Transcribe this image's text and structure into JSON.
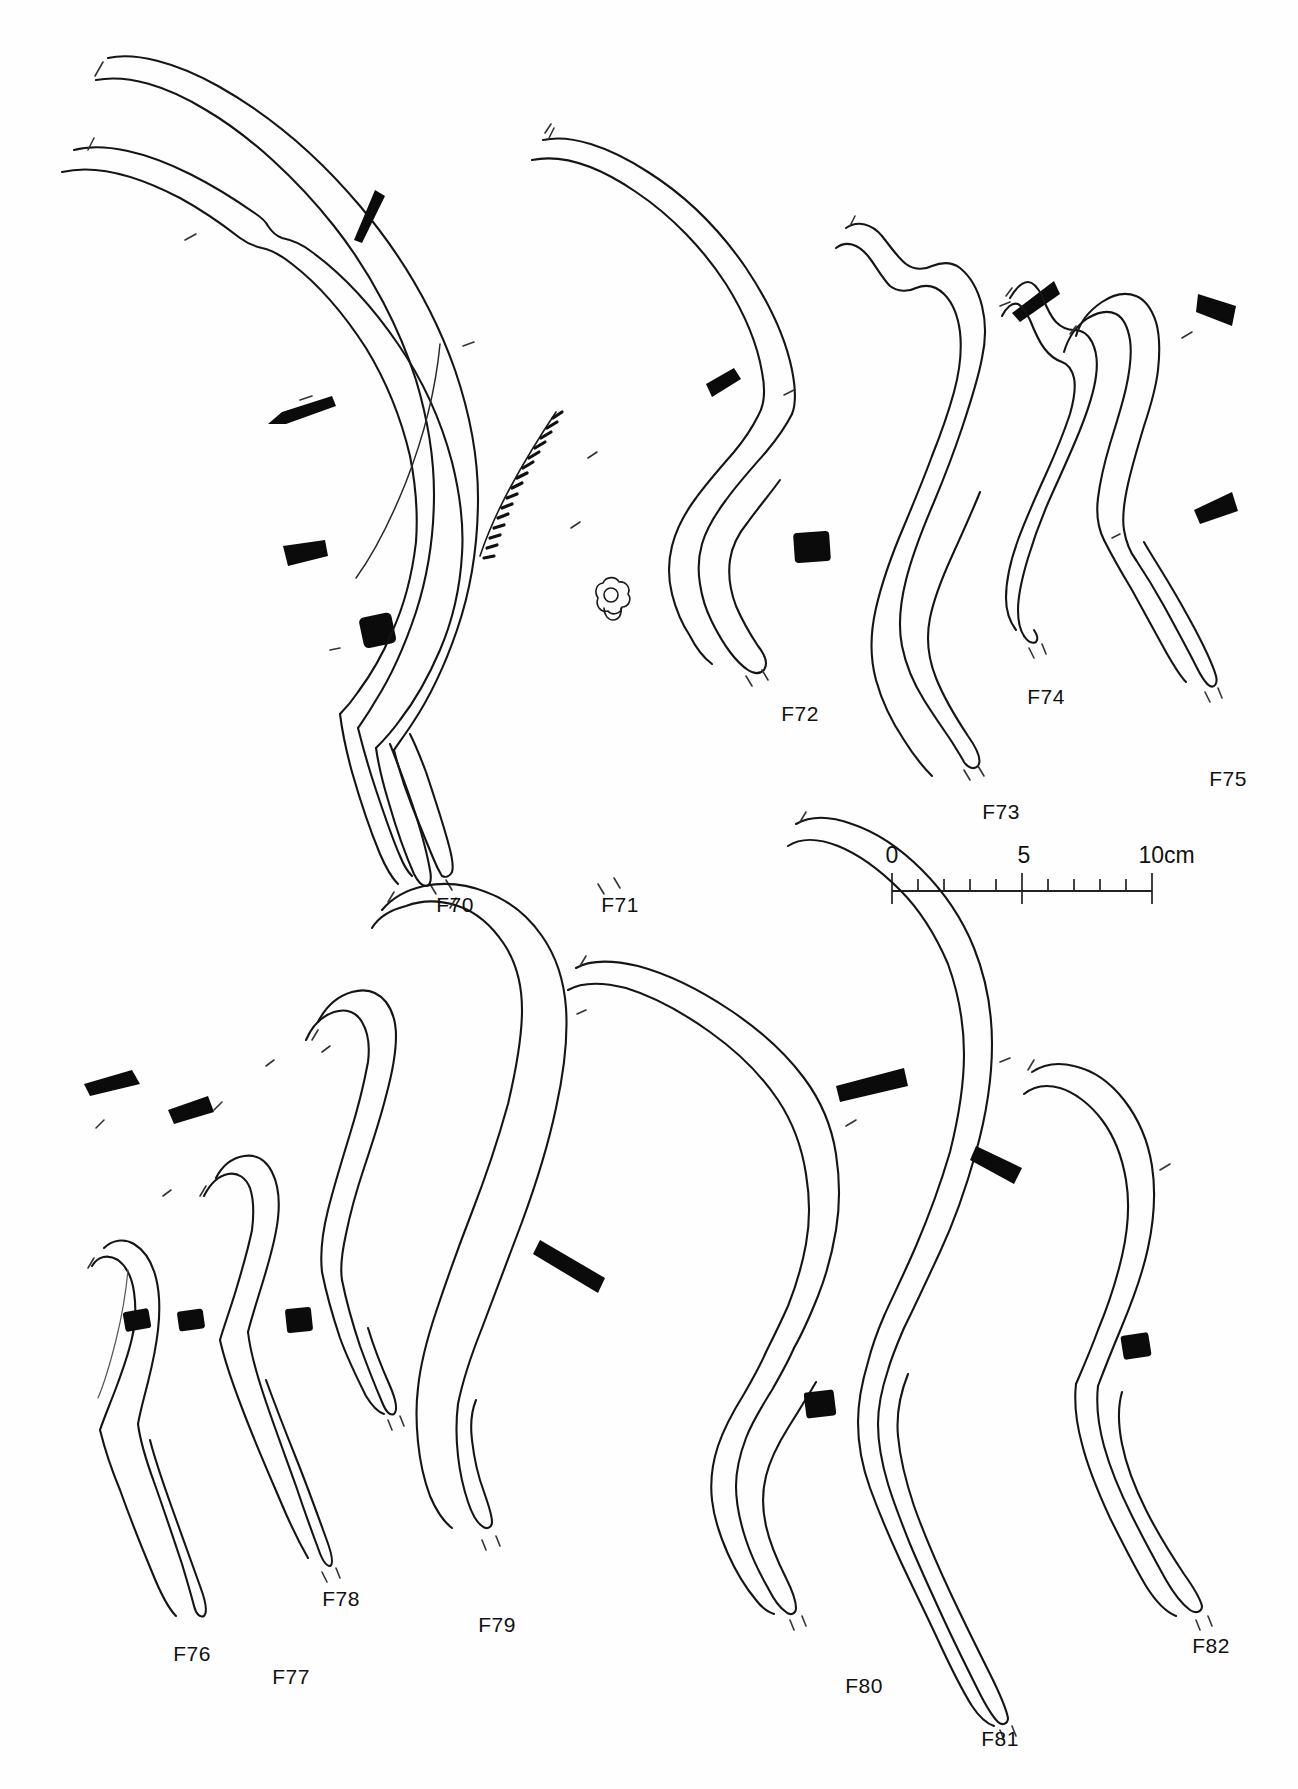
{
  "plate": {
    "title": "Archaeological artefact plate",
    "description": "Line drawings of thirteen curved bone/antler artefacts with cross-section profiles",
    "background_color": "#ffffff",
    "ink_color": "#151515",
    "cross_section_fill": "#0b0b0b"
  },
  "artefacts": [
    {
      "id": "F70",
      "label": "F70",
      "label_x": 455,
      "label_y": 893,
      "row": "top"
    },
    {
      "id": "F71",
      "label": "F71",
      "label_x": 620,
      "label_y": 893,
      "row": "top"
    },
    {
      "id": "F72",
      "label": "F72",
      "label_x": 800,
      "label_y": 702,
      "row": "top"
    },
    {
      "id": "F73",
      "label": "F73",
      "label_x": 1001,
      "label_y": 800,
      "row": "top"
    },
    {
      "id": "F74",
      "label": "F74",
      "label_x": 1046,
      "label_y": 685,
      "row": "top"
    },
    {
      "id": "F75",
      "label": "F75",
      "label_x": 1228,
      "label_y": 767,
      "row": "top"
    },
    {
      "id": "F76",
      "label": "F76",
      "label_x": 192,
      "label_y": 1642,
      "row": "bottom"
    },
    {
      "id": "F77",
      "label": "F77",
      "label_x": 291,
      "label_y": 1665,
      "row": "bottom"
    },
    {
      "id": "F78",
      "label": "F78",
      "label_x": 341,
      "label_y": 1587,
      "row": "bottom"
    },
    {
      "id": "F79",
      "label": "F79",
      "label_x": 497,
      "label_y": 1613,
      "row": "bottom"
    },
    {
      "id": "F80",
      "label": "F80",
      "label_x": 864,
      "label_y": 1674,
      "row": "bottom"
    },
    {
      "id": "F81",
      "label": "F81",
      "label_x": 1000,
      "label_y": 1727,
      "row": "bottom"
    },
    {
      "id": "F82",
      "label": "F82",
      "label_x": 1211,
      "label_y": 1634,
      "row": "bottom"
    }
  ],
  "scale": {
    "unit": "cm",
    "labels": [
      {
        "text": "0",
        "x": 892,
        "y": 855
      },
      {
        "text": "5",
        "x": 1024,
        "y": 855
      },
      {
        "text": "10cm",
        "x": 1153,
        "y": 855
      }
    ],
    "bar": {
      "x_start": 892,
      "x_end": 1152,
      "y": 891,
      "major_every": 5,
      "minor_ticks": 10
    },
    "max_value": 10,
    "min_value": 0
  }
}
